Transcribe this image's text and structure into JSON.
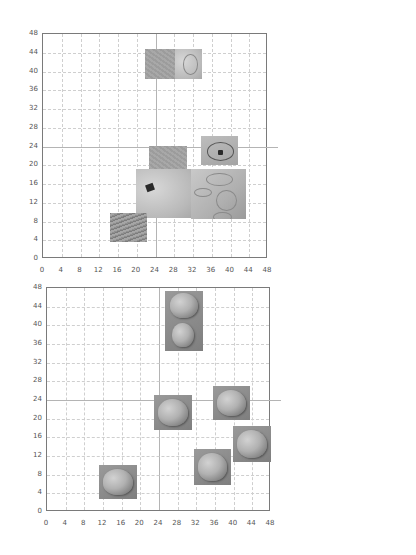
{
  "chart_data": [
    {
      "type": "scatter",
      "title": "",
      "xlabel": "",
      "ylabel": "",
      "xlim": [
        0,
        48
      ],
      "ylim": [
        0,
        48
      ],
      "grid": true,
      "x_ticks": [
        "0",
        "4",
        "8",
        "12",
        "16",
        "20",
        "24",
        "28",
        "32",
        "36",
        "40",
        "44",
        "48"
      ],
      "y_ticks": [
        "0",
        "4",
        "8",
        "12",
        "16",
        "20",
        "24",
        "28",
        "32",
        "36",
        "40",
        "44",
        "48"
      ],
      "points_are_images": true,
      "images": [
        {
          "name": "texture-pair-with-ring",
          "x": [
            21.8,
            34.0
          ],
          "y": [
            38.5,
            44.8
          ],
          "style": "pair"
        },
        {
          "name": "gray-texture",
          "x": [
            22.6,
            30.7
          ],
          "y": [
            19.0,
            24.1
          ],
          "style": "gray"
        },
        {
          "name": "cell-with-dark-spot",
          "x": [
            33.7,
            41.6
          ],
          "y": [
            20.1,
            26.3
          ],
          "style": "spot"
        },
        {
          "name": "large-light-with-dark-spot",
          "x": [
            19.8,
            31.8
          ],
          "y": [
            8.7,
            19.2
          ],
          "style": "light"
        },
        {
          "name": "large-cells-rings",
          "x": [
            31.6,
            43.3
          ],
          "y": [
            8.5,
            19.2
          ],
          "style": "cells"
        },
        {
          "name": "fine-fibrous-texture",
          "x": [
            14.3,
            22.2
          ],
          "y": [
            3.6,
            9.8
          ],
          "style": "fine"
        }
      ]
    },
    {
      "type": "scatter",
      "title": "",
      "xlabel": "",
      "ylabel": "",
      "xlim": [
        0,
        48
      ],
      "ylim": [
        0,
        48
      ],
      "grid": true,
      "x_ticks": [
        "0",
        "4",
        "8",
        "12",
        "16",
        "20",
        "24",
        "28",
        "32",
        "36",
        "40",
        "44",
        "48"
      ],
      "y_ticks": [
        "0",
        "4",
        "8",
        "12",
        "16",
        "20",
        "24",
        "28",
        "32",
        "36",
        "40",
        "44",
        "48"
      ],
      "points_are_images": true,
      "images": [
        {
          "name": "shell-pair-tall",
          "x": [
            25.3,
            33.4
          ],
          "y": [
            34.5,
            47.4
          ],
          "style": "shell-pair"
        },
        {
          "name": "shell-left",
          "x": [
            22.9,
            31.1
          ],
          "y": [
            17.6,
            25.1
          ],
          "style": "shell"
        },
        {
          "name": "shell-upper-right",
          "x": [
            35.6,
            43.5
          ],
          "y": [
            19.7,
            27.0
          ],
          "style": "shell"
        },
        {
          "name": "shell-right",
          "x": [
            39.9,
            48.0
          ],
          "y": [
            10.7,
            18.4
          ],
          "style": "shell"
        },
        {
          "name": "shell-bottom-center",
          "x": [
            31.5,
            39.4
          ],
          "y": [
            5.8,
            13.5
          ],
          "style": "shell"
        },
        {
          "name": "shell-bottom-left",
          "x": [
            11.1,
            19.3
          ],
          "y": [
            2.8,
            10.1
          ],
          "style": "shell"
        }
      ]
    }
  ],
  "layout": {
    "charts": [
      {
        "plot_left": 42,
        "plot_top": 33,
        "plot_size": 225
      },
      {
        "plot_left": 46,
        "plot_top": 287,
        "plot_size": 224
      }
    ]
  }
}
